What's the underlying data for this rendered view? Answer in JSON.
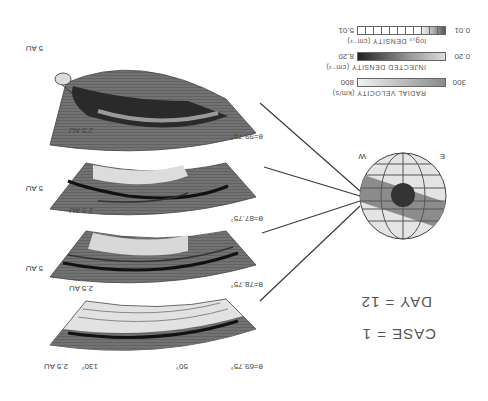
{
  "header": {
    "case_label": "CASE = 1",
    "day_label": "DAY = 12"
  },
  "legend": {
    "items": [
      {
        "title": "RADIAL VELOCITY (km/s)",
        "min": "300",
        "max": "800",
        "style": "radial-velocity"
      },
      {
        "title": "INJECTED DENSITY (cm⁻³)",
        "min": "0.20",
        "max": "8.20",
        "style": "injected-density"
      },
      {
        "title": "log₁₀ DENSITY (cm⁻³)",
        "min": "0.01",
        "max": "5.01",
        "style": "log-density"
      }
    ]
  },
  "sphere": {
    "east_label": "E",
    "west_label": "W"
  },
  "panels": [
    {
      "theta_label": "θ=69.75°",
      "inner_label": "2.5 AU",
      "outer_label": "5 AU",
      "angle_left": "50°",
      "angle_right": "130°"
    },
    {
      "theta_label": "θ=78.75°",
      "inner_label": "2.5 AU",
      "outer_label": "5 AU"
    },
    {
      "theta_label": "θ=87.75°",
      "inner_label": "2.5 AU",
      "outer_label": "5 AU"
    },
    {
      "theta_label": "θ=99.75°",
      "inner_label": "2.5 AU",
      "outer_label": "5 AU"
    }
  ],
  "colors": {
    "background": "#ffffff",
    "panel_dark": "#6e6e6e",
    "panel_mid": "#9a9a9a",
    "panel_light": "#dcdcdc",
    "sphere_band": "#8c8c8c",
    "sphere_bg": "#e4e4e4",
    "cloud_core": "#333333",
    "line": "#3a3a3a"
  }
}
